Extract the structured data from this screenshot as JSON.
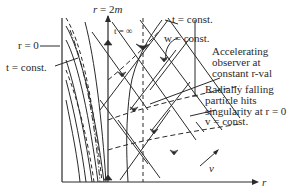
{
  "diagram": {
    "type": "spacetime-diagram",
    "axes": {
      "horizontal": {
        "label": "r"
      },
      "oblique": {
        "label": "v"
      }
    },
    "labels": {
      "r_horizon": "r = 2m",
      "r_zero": "r = 0",
      "t_const_left": "t = const.",
      "t_const_top": "t = const.",
      "t_infinity": "t = ∞",
      "w_const": "w = const.",
      "accelerating_observer": [
        "Accelerating",
        "observer at",
        "constant r-val"
      ],
      "radially_falling": [
        "Radially falling",
        "particle hits",
        "singularity at r = 0"
      ],
      "v_const": "v = const."
    },
    "colors": {
      "line": "#2a2a2a",
      "background": "#ffffff"
    }
  }
}
